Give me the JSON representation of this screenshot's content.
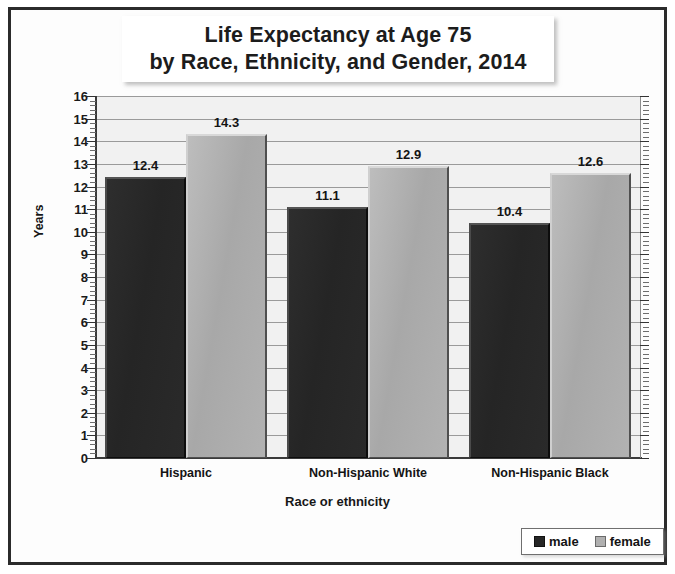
{
  "chart_data": {
    "type": "bar",
    "title": "Life Expectancy at Age 75 by Race, Ethnicity, and Gender, 2014",
    "title_lines": [
      "Life Expectancy at Age 75",
      "by Race, Ethnicity, and Gender, 2014"
    ],
    "xlabel": "Race or ethnicity",
    "ylabel": "Years",
    "categories": [
      "Hispanic",
      "Non-Hispanic White",
      "Non-Hispanic Black"
    ],
    "series": [
      {
        "name": "male",
        "color": "#262626",
        "values": [
          12.4,
          11.1,
          10.4
        ]
      },
      {
        "name": "female",
        "color": "#b0b0b0",
        "values": [
          14.3,
          12.9,
          12.6
        ]
      }
    ],
    "ylim": [
      0,
      16
    ],
    "ytick_step": 1,
    "yticks": [
      0,
      1,
      2,
      3,
      4,
      5,
      6,
      7,
      8,
      9,
      10,
      11,
      12,
      13,
      14,
      15,
      16
    ],
    "ytick_labels": [
      "0",
      "1",
      "2",
      "3",
      "4",
      "5",
      "6",
      "7",
      "8",
      "9",
      "10",
      "11",
      "12",
      "13",
      "14",
      "15",
      "16"
    ],
    "minor_ticks_per_interval": 4,
    "grid": true,
    "grid_axis": "y",
    "legend_position": "bottom-right",
    "data_labels": true,
    "plot_background": "#f1f1f1",
    "frame_color": "#2b2b2b"
  }
}
